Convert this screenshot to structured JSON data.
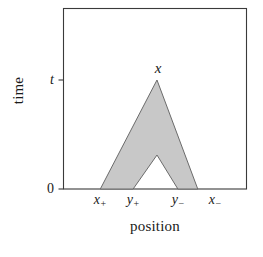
{
  "figure": {
    "background_color": "#ffffff",
    "frame_color": "#3a3a3a"
  },
  "axes": {
    "x_title": "position",
    "y_title": "time"
  },
  "chart_data": {
    "type": "area",
    "title": "",
    "xlabel": "position",
    "ylabel": "time",
    "grid": false,
    "legend": null,
    "xlim": [
      0,
      1
    ],
    "ylim": [
      0,
      1
    ],
    "x_ticks": [
      {
        "label": "x",
        "sub": "+",
        "position": 0.2011
      },
      {
        "label": "y",
        "sub": "+",
        "position": 0.3804
      },
      {
        "label": "y",
        "sub": "−",
        "position": 0.625
      },
      {
        "label": "x",
        "sub": "−",
        "position": 0.7337
      }
    ],
    "y_ticks": [
      {
        "label": "0",
        "position": 0.0
      },
      {
        "label": "t",
        "position": 0.6022
      }
    ],
    "annotations": [
      {
        "text": "x",
        "x": 0.5109,
        "y": 0.6685
      }
    ],
    "series": [
      {
        "name": "light-cone-region",
        "type": "polygon",
        "fill": "#c8c8c8",
        "stroke": "#6b6b6b",
        "points": [
          [
            0.2011,
            0.0
          ],
          [
            0.5109,
            0.6022
          ],
          [
            0.7337,
            0.0
          ],
          [
            0.625,
            0.0
          ],
          [
            0.5109,
            0.1878
          ],
          [
            0.3804,
            0.0
          ]
        ]
      }
    ]
  }
}
